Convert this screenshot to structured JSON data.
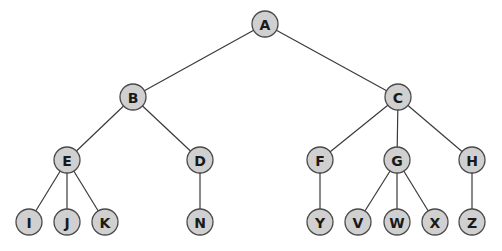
{
  "diagram": {
    "type": "tree",
    "nodes": [
      {
        "id": "A",
        "label": "A",
        "x": 265,
        "y": 24
      },
      {
        "id": "B",
        "label": "B",
        "x": 133,
        "y": 97
      },
      {
        "id": "C",
        "label": "C",
        "x": 398,
        "y": 97
      },
      {
        "id": "E",
        "label": "E",
        "x": 67,
        "y": 160
      },
      {
        "id": "D",
        "label": "D",
        "x": 200,
        "y": 160
      },
      {
        "id": "F",
        "label": "F",
        "x": 320,
        "y": 160
      },
      {
        "id": "G",
        "label": "G",
        "x": 397,
        "y": 160
      },
      {
        "id": "H",
        "label": "H",
        "x": 472,
        "y": 160
      },
      {
        "id": "I",
        "label": "I",
        "x": 29,
        "y": 222
      },
      {
        "id": "J",
        "label": "J",
        "x": 67,
        "y": 222
      },
      {
        "id": "K",
        "label": "K",
        "x": 105,
        "y": 222
      },
      {
        "id": "N",
        "label": "N",
        "x": 200,
        "y": 222
      },
      {
        "id": "Y",
        "label": "Y",
        "x": 320,
        "y": 222
      },
      {
        "id": "V",
        "label": "V",
        "x": 358,
        "y": 222
      },
      {
        "id": "W",
        "label": "W",
        "x": 397,
        "y": 222
      },
      {
        "id": "X",
        "label": "X",
        "x": 435,
        "y": 222
      },
      {
        "id": "Z",
        "label": "Z",
        "x": 472,
        "y": 222
      }
    ],
    "edges": [
      [
        "A",
        "B"
      ],
      [
        "A",
        "C"
      ],
      [
        "B",
        "E"
      ],
      [
        "B",
        "D"
      ],
      [
        "C",
        "F"
      ],
      [
        "C",
        "G"
      ],
      [
        "C",
        "H"
      ],
      [
        "E",
        "I"
      ],
      [
        "E",
        "J"
      ],
      [
        "E",
        "K"
      ],
      [
        "D",
        "N"
      ],
      [
        "F",
        "Y"
      ],
      [
        "G",
        "V"
      ],
      [
        "G",
        "W"
      ],
      [
        "G",
        "X"
      ],
      [
        "H",
        "Z"
      ]
    ],
    "node_radius": 13
  }
}
